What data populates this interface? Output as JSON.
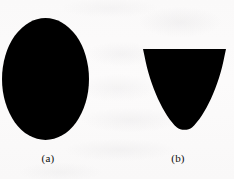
{
  "figure": {
    "background_color": "#fbfafa",
    "ink_color": "#000000",
    "width": 234,
    "height": 179,
    "panels": [
      {
        "id": "a",
        "label": "(a)",
        "label_x": 48,
        "label_y": 152,
        "shape_name": "filled-ellipse",
        "fill": "#000000",
        "center_x": 45.5,
        "center_y": 79,
        "radius_x": 43.5,
        "radius_y": 61
      },
      {
        "id": "b",
        "label": "(b)",
        "label_x": 178,
        "label_y": 152,
        "shape_name": "filled-parabolic-segment",
        "fill": "#000000",
        "top_left_x": 143,
        "top_right_x": 226,
        "top_y": 49,
        "vertex_x": 184.5,
        "vertex_y": 131
      }
    ]
  }
}
